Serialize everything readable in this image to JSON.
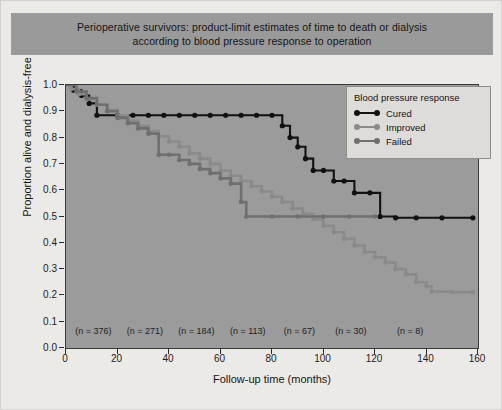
{
  "title": {
    "line1": "Perioperative survivors: product-limit estimates of time to death or dialysis",
    "line2": "according to blood pressure response to operation"
  },
  "legend": {
    "title": "Blood pressure response",
    "items": [
      {
        "label": "Cured",
        "color": "#111111"
      },
      {
        "label": "Improved",
        "color": "#8a8a8a"
      },
      {
        "label": "Failed",
        "color": "#6f6f6f"
      }
    ]
  },
  "at_risk": {
    "labels": [
      "(n = 376)",
      "(n = 271)",
      "(n = 184)",
      "(n = 113)",
      "(n = 67)",
      "(n = 30)",
      "(n = 8)"
    ],
    "x_positions": [
      11,
      31,
      51,
      71,
      91,
      111,
      134
    ]
  },
  "chart_data": {
    "type": "line",
    "title": "Perioperative survivors: product-limit estimates of time to death or dialysis according to blood pressure response to operation",
    "xlabel": "Follow-up time (months)",
    "ylabel": "Proportion alive and dialysis-free",
    "xlim": [
      0,
      160
    ],
    "ylim": [
      0.0,
      1.0
    ],
    "xticks": [
      0,
      20,
      40,
      60,
      80,
      100,
      120,
      140,
      160
    ],
    "yticks": [
      0.0,
      0.1,
      0.2,
      0.3,
      0.4,
      0.5,
      0.6,
      0.7,
      0.8,
      0.9,
      1.0
    ],
    "grid": false,
    "legend_position": "top-right",
    "step_type": "post",
    "annotations": [
      {
        "text": "(n = 376)",
        "x": 11,
        "y": 0.045
      },
      {
        "text": "(n = 271)",
        "x": 31,
        "y": 0.045
      },
      {
        "text": "(n = 184)",
        "x": 51,
        "y": 0.045
      },
      {
        "text": "(n = 113)",
        "x": 71,
        "y": 0.045
      },
      {
        "text": "(n = 67)",
        "x": 91,
        "y": 0.045
      },
      {
        "text": "(n = 30)",
        "x": 111,
        "y": 0.045
      },
      {
        "text": "(n = 8)",
        "x": 134,
        "y": 0.045
      }
    ],
    "series": [
      {
        "name": "Cured",
        "color": "#111111",
        "censor_marks": true,
        "points": [
          [
            0,
            1.0
          ],
          [
            3,
            0.98
          ],
          [
            6,
            0.96
          ],
          [
            9,
            0.93
          ],
          [
            12,
            0.885
          ],
          [
            20,
            0.885
          ],
          [
            26,
            0.885
          ],
          [
            32,
            0.885
          ],
          [
            38,
            0.885
          ],
          [
            44,
            0.885
          ],
          [
            50,
            0.885
          ],
          [
            56,
            0.885
          ],
          [
            62,
            0.885
          ],
          [
            68,
            0.885
          ],
          [
            74,
            0.885
          ],
          [
            80,
            0.885
          ],
          [
            84,
            0.845
          ],
          [
            87,
            0.8
          ],
          [
            90,
            0.765
          ],
          [
            93,
            0.72
          ],
          [
            96,
            0.675
          ],
          [
            100,
            0.675
          ],
          [
            104,
            0.635
          ],
          [
            108,
            0.635
          ],
          [
            112,
            0.59
          ],
          [
            118,
            0.59
          ],
          [
            122,
            0.5
          ],
          [
            128,
            0.495
          ],
          [
            136,
            0.495
          ],
          [
            146,
            0.495
          ],
          [
            158,
            0.495
          ]
        ]
      },
      {
        "name": "Improved",
        "color": "#8a8a8a",
        "censor_marks": true,
        "points": [
          [
            0,
            1.0
          ],
          [
            2,
            0.985
          ],
          [
            5,
            0.965
          ],
          [
            8,
            0.945
          ],
          [
            12,
            0.925
          ],
          [
            16,
            0.905
          ],
          [
            20,
            0.885
          ],
          [
            24,
            0.865
          ],
          [
            28,
            0.845
          ],
          [
            32,
            0.825
          ],
          [
            36,
            0.805
          ],
          [
            40,
            0.785
          ],
          [
            44,
            0.765
          ],
          [
            48,
            0.74
          ],
          [
            52,
            0.72
          ],
          [
            56,
            0.7
          ],
          [
            60,
            0.675
          ],
          [
            64,
            0.655
          ],
          [
            68,
            0.635
          ],
          [
            72,
            0.615
          ],
          [
            76,
            0.595
          ],
          [
            80,
            0.575
          ],
          [
            84,
            0.555
          ],
          [
            88,
            0.53
          ],
          [
            92,
            0.51
          ],
          [
            96,
            0.49
          ],
          [
            100,
            0.465
          ],
          [
            104,
            0.44
          ],
          [
            108,
            0.415
          ],
          [
            112,
            0.39
          ],
          [
            116,
            0.365
          ],
          [
            120,
            0.345
          ],
          [
            124,
            0.325
          ],
          [
            128,
            0.3
          ],
          [
            132,
            0.28
          ],
          [
            136,
            0.25
          ],
          [
            140,
            0.235
          ],
          [
            142,
            0.215
          ],
          [
            150,
            0.212
          ],
          [
            158,
            0.212
          ]
        ]
      },
      {
        "name": "Failed",
        "color": "#6f6f6f",
        "censor_marks": true,
        "points": [
          [
            0,
            1.0
          ],
          [
            4,
            0.975
          ],
          [
            8,
            0.95
          ],
          [
            12,
            0.925
          ],
          [
            16,
            0.9
          ],
          [
            20,
            0.875
          ],
          [
            24,
            0.855
          ],
          [
            28,
            0.835
          ],
          [
            32,
            0.815
          ],
          [
            36,
            0.735
          ],
          [
            40,
            0.735
          ],
          [
            44,
            0.715
          ],
          [
            48,
            0.7
          ],
          [
            52,
            0.68
          ],
          [
            56,
            0.665
          ],
          [
            60,
            0.645
          ],
          [
            64,
            0.625
          ],
          [
            68,
            0.555
          ],
          [
            70,
            0.5
          ],
          [
            80,
            0.5
          ],
          [
            90,
            0.5
          ],
          [
            100,
            0.5
          ],
          [
            110,
            0.5
          ],
          [
            120,
            0.5
          ]
        ]
      }
    ]
  }
}
